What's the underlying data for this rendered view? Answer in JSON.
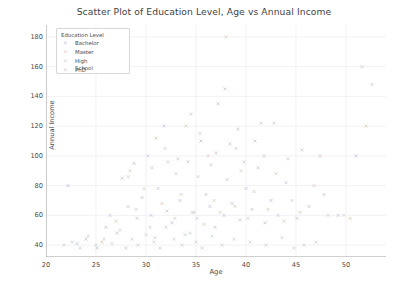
{
  "chart_data": {
    "type": "scatter",
    "title": "Scatter Plot of Education Level, Age vs Annual Income",
    "xlabel": "Age",
    "ylabel": "Annual Income",
    "xlim": [
      20,
      54
    ],
    "ylim": [
      32,
      188
    ],
    "xticks": [
      20,
      25,
      30,
      35,
      40,
      45,
      50
    ],
    "yticks": [
      40,
      60,
      80,
      100,
      120,
      140,
      160,
      180
    ],
    "grid": true,
    "legend": {
      "title": "Education Level",
      "position": "upper-left-inside",
      "entries": [
        {
          "label": "Bachelor",
          "color": "#c9cfe0",
          "marker": "x"
        },
        {
          "label": "Master",
          "color": "#e3d3c4",
          "marker": "x"
        },
        {
          "label": "High School",
          "color": "#cfdcd0",
          "marker": "x"
        },
        {
          "label": "PhD",
          "color": "#e0cdcd",
          "marker": "x"
        }
      ]
    },
    "series": [
      {
        "name": "Bachelor",
        "color": "#c9cfe0",
        "marker": "x",
        "points": [
          [
            22.2,
            80
          ],
          [
            23.1,
            41
          ],
          [
            24.0,
            44
          ],
          [
            25.1,
            38
          ],
          [
            26.0,
            52
          ],
          [
            26.4,
            60
          ],
          [
            27.1,
            48
          ],
          [
            27.6,
            85
          ],
          [
            28.2,
            66
          ],
          [
            28.8,
            95
          ],
          [
            29.1,
            58
          ],
          [
            29.6,
            72
          ],
          [
            30.2,
            100
          ],
          [
            30.5,
            60
          ],
          [
            30.9,
            45
          ],
          [
            31.2,
            78
          ],
          [
            31.8,
            120
          ],
          [
            32.1,
            63
          ],
          [
            32.6,
            55
          ],
          [
            33.0,
            88
          ],
          [
            33.4,
            70
          ],
          [
            33.9,
            47
          ],
          [
            34.2,
            96
          ],
          [
            34.8,
            62
          ],
          [
            35.1,
            58
          ],
          [
            35.5,
            110
          ],
          [
            36.0,
            74
          ],
          [
            36.4,
            66
          ],
          [
            36.9,
            52
          ],
          [
            37.2,
            135
          ],
          [
            37.8,
            60
          ],
          [
            38.1,
            84
          ],
          [
            38.6,
            68
          ],
          [
            39.0,
            105
          ],
          [
            39.4,
            57
          ],
          [
            40.0,
            78
          ],
          [
            40.6,
            64
          ],
          [
            41.2,
            92
          ],
          [
            41.9,
            55
          ],
          [
            42.5,
            70
          ],
          [
            43.2,
            60
          ],
          [
            44.0,
            82
          ],
          [
            45.1,
            58
          ],
          [
            46.3,
            66
          ],
          [
            47.8,
            74
          ],
          [
            49.2,
            60
          ],
          [
            51.0,
            100
          ]
        ]
      },
      {
        "name": "Master",
        "color": "#e3d3c4",
        "marker": "x",
        "points": [
          [
            25.6,
            42
          ],
          [
            27.0,
            56
          ],
          [
            28.4,
            90
          ],
          [
            29.0,
            64
          ],
          [
            29.8,
            78
          ],
          [
            30.4,
            52
          ],
          [
            31.0,
            112
          ],
          [
            31.6,
            68
          ],
          [
            32.2,
            96
          ],
          [
            32.9,
            58
          ],
          [
            33.5,
            74
          ],
          [
            34.0,
            120
          ],
          [
            34.6,
            62
          ],
          [
            35.2,
            86
          ],
          [
            35.8,
            54
          ],
          [
            36.2,
            100
          ],
          [
            36.8,
            70
          ],
          [
            37.4,
            62
          ],
          [
            38.0,
            180
          ],
          [
            38.4,
            108
          ],
          [
            38.9,
            66
          ],
          [
            39.5,
            90
          ],
          [
            40.2,
            58
          ],
          [
            40.8,
            76
          ],
          [
            41.5,
            122
          ],
          [
            42.2,
            64
          ],
          [
            43.0,
            88
          ],
          [
            43.8,
            56
          ],
          [
            44.6,
            70
          ],
          [
            45.4,
            62
          ],
          [
            46.8,
            80
          ],
          [
            48.2,
            60
          ],
          [
            50.4,
            58
          ],
          [
            52.0,
            120
          ]
        ]
      },
      {
        "name": "High School",
        "color": "#cfdcd0",
        "marker": "x",
        "points": [
          [
            21.8,
            40
          ],
          [
            22.6,
            42
          ],
          [
            23.4,
            38
          ],
          [
            24.2,
            46
          ],
          [
            25.0,
            40
          ],
          [
            25.8,
            44
          ],
          [
            26.6,
            41
          ],
          [
            27.4,
            50
          ],
          [
            28.0,
            38
          ],
          [
            28.6,
            44
          ],
          [
            29.2,
            40
          ],
          [
            30.0,
            47
          ],
          [
            30.8,
            42
          ],
          [
            31.4,
            38
          ],
          [
            32.0,
            52
          ],
          [
            32.8,
            44
          ],
          [
            33.6,
            40
          ],
          [
            34.4,
            48
          ],
          [
            35.0,
            42
          ],
          [
            35.6,
            38
          ],
          [
            36.6,
            46
          ],
          [
            37.6,
            40
          ],
          [
            38.8,
            44
          ],
          [
            40.4,
            42
          ],
          [
            42.0,
            40
          ],
          [
            43.6,
            45
          ],
          [
            45.8,
            40
          ],
          [
            47.0,
            42
          ],
          [
            49.8,
            60
          ],
          [
            44.8,
            38
          ]
        ]
      },
      {
        "name": "PhD",
        "color": "#e0cdcd",
        "marker": "x",
        "points": [
          [
            28.2,
            86
          ],
          [
            30.6,
            92
          ],
          [
            31.9,
            105
          ],
          [
            33.2,
            98
          ],
          [
            34.5,
            128
          ],
          [
            35.4,
            115
          ],
          [
            36.5,
            94
          ],
          [
            37.0,
            102
          ],
          [
            37.9,
            145
          ],
          [
            39.2,
            118
          ],
          [
            39.8,
            96
          ],
          [
            40.9,
            110
          ],
          [
            41.8,
            100
          ],
          [
            42.8,
            122
          ],
          [
            44.2,
            98
          ],
          [
            45.6,
            104
          ],
          [
            47.4,
            100
          ],
          [
            51.6,
            160
          ],
          [
            52.6,
            148
          ]
        ]
      }
    ]
  }
}
